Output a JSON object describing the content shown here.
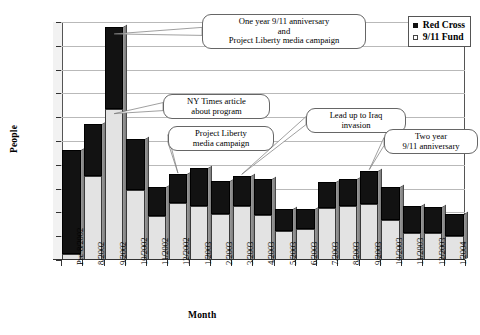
{
  "chart_data": {
    "type": "bar",
    "subtype": "stacked-bar",
    "title": "",
    "xlabel": "Month",
    "ylabel": "People",
    "ylim": [
      0,
      2000
    ],
    "ytick_step": 200,
    "yticks": [
      0,
      200,
      400,
      600,
      800,
      1000,
      1200,
      1400,
      1600,
      1800,
      2000
    ],
    "grid": true,
    "legend_position": "top-right",
    "categories": [
      "Pre-8/2002",
      "8/2002",
      "9/2002",
      "10/2002",
      "11/2002",
      "12/2002",
      "1/2003",
      "2/2003",
      "3/2003",
      "4/2003",
      "5/2003",
      "6/2003",
      "7/2003",
      "8/2003",
      "9/2003",
      "10/2003",
      "11/2003",
      "12/2003",
      "1/2004"
    ],
    "series": [
      {
        "name": "9/11 Fund",
        "color": "#e3e3e3",
        "stack_position": "bottom",
        "values": [
          50,
          710,
          1270,
          590,
          370,
          475,
          450,
          390,
          450,
          375,
          240,
          260,
          440,
          455,
          470,
          335,
          230,
          225,
          200
        ]
      },
      {
        "name": "Red Cross",
        "color": "#121212",
        "stack_position": "top",
        "values": [
          875,
          430,
          690,
          430,
          240,
          245,
          325,
          275,
          260,
          305,
          185,
          165,
          215,
          225,
          275,
          275,
          220,
          220,
          190
        ]
      }
    ],
    "totals": [
      925,
      1140,
      1960,
      1020,
      610,
      720,
      775,
      665,
      710,
      680,
      425,
      425,
      655,
      680,
      745,
      610,
      450,
      445,
      390
    ],
    "annotations": [
      {
        "id": "anniversary-one-year",
        "text": "One year 9/11 anniversary\nand\nProject Liberty media campaign",
        "lines": [
          "One year 9/11 anniversary",
          "and",
          "Project Liberty media campaign"
        ],
        "points_to": "9/2002"
      },
      {
        "id": "ny-times-article",
        "text": "NY Times article\nabout program",
        "lines": [
          "NY Times article",
          "about program"
        ],
        "points_to": "9/2002"
      },
      {
        "id": "project-liberty-campaign",
        "text": "Project Liberty\nmedia campaign",
        "lines": [
          "Project Liberty",
          "media campaign"
        ],
        "points_to": "12/2002"
      },
      {
        "id": "iraq-invasion",
        "text": "Lead up to Iraq\ninvasion",
        "lines": [
          "Lead up to Iraq",
          "invasion"
        ],
        "points_to": "3/2003"
      },
      {
        "id": "anniversary-two-year",
        "text": "Two year\n9/11 anniversary",
        "lines": [
          "Two year",
          "9/11 anniversary"
        ],
        "points_to": "9/2003"
      }
    ]
  },
  "legend": {
    "items": [
      {
        "label": "Red Cross",
        "marker": "filled-square"
      },
      {
        "label": "9/11 Fund",
        "marker": "open-square"
      }
    ]
  },
  "axes": {
    "y_title": "People",
    "x_title": "Month"
  }
}
